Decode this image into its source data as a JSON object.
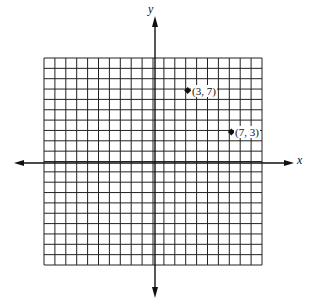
{
  "diagram": {
    "type": "coordinate-grid",
    "grid": {
      "cols": 20,
      "rows": 20,
      "x_range": [
        -10,
        10
      ],
      "y_range": [
        -10,
        10
      ]
    },
    "axes": {
      "x_label": "x",
      "y_label": "y"
    },
    "points": [
      {
        "x": 3,
        "y": 7,
        "label": "(3, 7)"
      },
      {
        "x": 7,
        "y": 3,
        "label": "(7, 3)"
      }
    ],
    "colors": {
      "line": "#111111",
      "background": "#ffffff"
    }
  }
}
